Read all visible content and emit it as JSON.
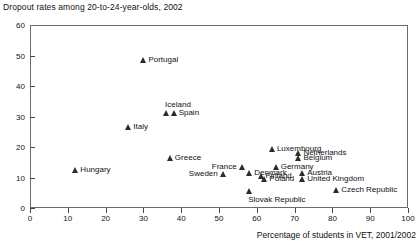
{
  "chart_data": {
    "type": "scatter",
    "title": "Dropout rates among 20-to-24-year-olds, 2002",
    "xlabel": "Percentage of students in VET, 2001/2002",
    "ylabel": "",
    "xlim": [
      0,
      100
    ],
    "ylim": [
      0,
      60
    ],
    "xticks": [
      0,
      10,
      20,
      30,
      40,
      50,
      60,
      70,
      80,
      90,
      100
    ],
    "yticks": [
      0,
      10,
      20,
      30,
      40,
      50,
      60
    ],
    "grid": false,
    "legend": null,
    "marker": "triangle",
    "points": [
      {
        "name": "Hungary",
        "x": 12,
        "y": 12.5,
        "label_pos": "right"
      },
      {
        "name": "Italy",
        "x": 26,
        "y": 26.5,
        "label_pos": "right"
      },
      {
        "name": "Portugal",
        "x": 30,
        "y": 48.5,
        "label_pos": "right"
      },
      {
        "name": "Greece",
        "x": 37,
        "y": 16.5,
        "label_pos": "right"
      },
      {
        "name": "Iceland",
        "x": 36,
        "y": 31.0,
        "label_pos": "above"
      },
      {
        "name": "Spain",
        "x": 38,
        "y": 31.0,
        "label_pos": "right"
      },
      {
        "name": "Sweden",
        "x": 51,
        "y": 11.0,
        "label_pos": "left"
      },
      {
        "name": "France",
        "x": 56,
        "y": 13.5,
        "label_pos": "left"
      },
      {
        "name": "Denmark",
        "x": 58,
        "y": 11.5,
        "label_pos": "right"
      },
      {
        "name": "Slovak Republic",
        "x": 58,
        "y": 5.5,
        "label_pos": "below"
      },
      {
        "name": "Finland",
        "x": 61,
        "y": 10.5,
        "label_pos": "right"
      },
      {
        "name": "Poland",
        "x": 62,
        "y": 9.5,
        "label_pos": "right"
      },
      {
        "name": "Luxembourg",
        "x": 64,
        "y": 19.5,
        "label_pos": "right"
      },
      {
        "name": "Germany",
        "x": 65,
        "y": 13.5,
        "label_pos": "right"
      },
      {
        "name": "Belgium",
        "x": 71,
        "y": 16.5,
        "label_pos": "right"
      },
      {
        "name": "Netherlands",
        "x": 71,
        "y": 18.0,
        "label_pos": "right"
      },
      {
        "name": "Austria",
        "x": 72,
        "y": 11.5,
        "label_pos": "right"
      },
      {
        "name": "United Kingdom",
        "x": 72,
        "y": 9.5,
        "label_pos": "right"
      },
      {
        "name": "Czech Republic",
        "x": 81,
        "y": 6.0,
        "label_pos": "right"
      }
    ]
  }
}
